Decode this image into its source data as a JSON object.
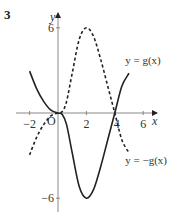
{
  "question_number": "3",
  "chart_data": {
    "type": "line",
    "title": "",
    "xlabel": "x",
    "ylabel": "y",
    "origin_label": "O",
    "xlim": [
      -3,
      7
    ],
    "ylim": [
      -7,
      7
    ],
    "grid": false,
    "x_ticks": [
      -2,
      2,
      4,
      6
    ],
    "x_tick_labels": [
      "−2",
      "2",
      "4",
      "6"
    ],
    "y_ticks": [
      6,
      -6
    ],
    "y_tick_labels": [
      "6",
      "−6"
    ],
    "series": [
      {
        "name": "y = g(x)",
        "style": "solid",
        "points": [
          [
            -2,
            2.95
          ],
          [
            -1.5,
            1.7
          ],
          [
            -1,
            0.8
          ],
          [
            -0.5,
            0.2
          ],
          [
            0,
            0
          ],
          [
            0.3,
            -0.1
          ],
          [
            0.6,
            -0.8
          ],
          [
            1,
            -2.8
          ],
          [
            1.5,
            -5.2
          ],
          [
            2,
            -6
          ],
          [
            2.5,
            -5.4
          ],
          [
            3,
            -3.8
          ],
          [
            3.5,
            -1.9
          ],
          [
            4,
            0
          ],
          [
            4.5,
            1.9
          ],
          [
            5,
            2.8
          ]
        ],
        "label": {
          "text": "y = g(x)",
          "x": 5.3,
          "y": 3.7
        }
      },
      {
        "name": "y = −g(x)",
        "style": "dashed",
        "points": [
          [
            -2,
            -2.95
          ],
          [
            -1.5,
            -1.7
          ],
          [
            -1,
            -0.8
          ],
          [
            -0.5,
            -0.2
          ],
          [
            0,
            0
          ],
          [
            0.3,
            0.1
          ],
          [
            0.6,
            0.8
          ],
          [
            1,
            2.8
          ],
          [
            1.5,
            5.2
          ],
          [
            2,
            6
          ],
          [
            2.5,
            5.4
          ],
          [
            3,
            3.8
          ],
          [
            3.5,
            1.9
          ],
          [
            4,
            0
          ],
          [
            4.5,
            -1.9
          ],
          [
            5,
            -2.8
          ]
        ],
        "label": {
          "text": "y = −g(x)",
          "x": 5.3,
          "y": -3.3
        }
      }
    ],
    "annotations": [
      "Curves are reflections of each other in the x-axis",
      "Turning points at (2, 6) and (2, −6)"
    ]
  }
}
